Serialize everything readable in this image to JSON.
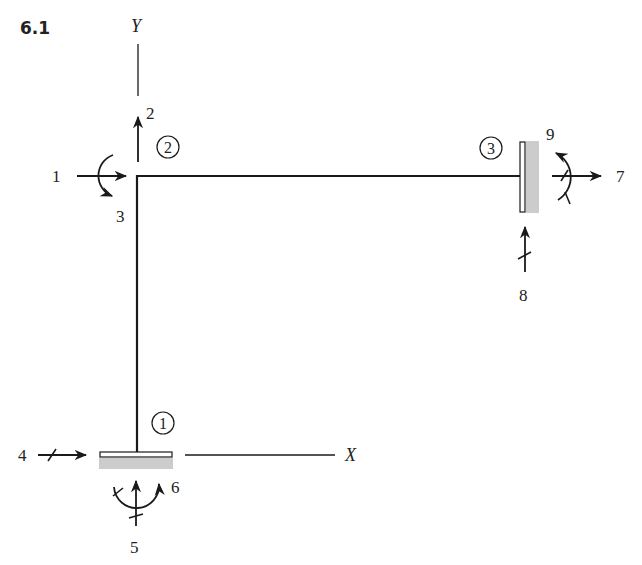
{
  "figure": {
    "number": "6.1",
    "axes": {
      "x_label": "X",
      "y_label": "Y"
    },
    "nodes": [
      {
        "id": "1",
        "label": "1",
        "support": "fixed (bottom)"
      },
      {
        "id": "2",
        "label": "2",
        "support": "free joint"
      },
      {
        "id": "3",
        "label": "3",
        "support": "fixed (right wall)"
      }
    ],
    "dof_labels": {
      "d1": "1",
      "d2": "2",
      "d3": "3",
      "d4": "4",
      "d5": "5",
      "d6": "6",
      "d7": "7",
      "d8": "8",
      "d9": "9"
    },
    "colors": {
      "line": "#1a1a1a",
      "support_fill": "#cccccc"
    }
  }
}
